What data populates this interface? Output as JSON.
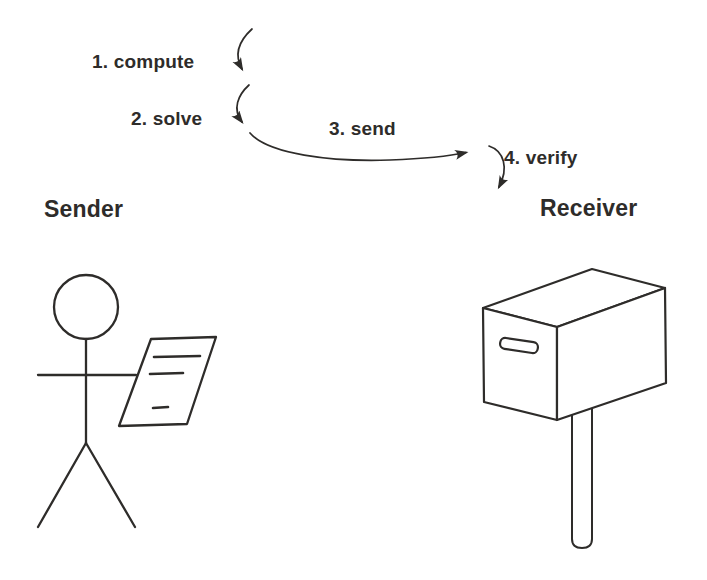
{
  "diagram": {
    "steps": [
      {
        "label": "1. compute"
      },
      {
        "label": "2. solve"
      },
      {
        "label": "3. send"
      },
      {
        "label": "4. verify"
      }
    ],
    "actors": {
      "sender": "Sender",
      "receiver": "Receiver"
    },
    "icons": [
      "curved-arrow-icon",
      "stick-figure-icon",
      "document-icon",
      "mailbox-icon"
    ]
  },
  "colors": {
    "ink": "#2e2c2a",
    "background": "#ffffff"
  }
}
